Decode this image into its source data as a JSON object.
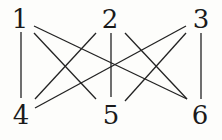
{
  "graph": {
    "name": "K3,3",
    "stroke_color": "#222222",
    "nodes": [
      {
        "id": "1",
        "label": "1",
        "x": 20,
        "y": 19
      },
      {
        "id": "2",
        "label": "2",
        "x": 110,
        "y": 19
      },
      {
        "id": "3",
        "label": "3",
        "x": 201,
        "y": 19
      },
      {
        "id": "4",
        "label": "4",
        "x": 21,
        "y": 115
      },
      {
        "id": "5",
        "label": "5",
        "x": 111,
        "y": 115
      },
      {
        "id": "6",
        "label": "6",
        "x": 200,
        "y": 115
      }
    ],
    "edges": [
      {
        "from": "1",
        "to": "4",
        "x1": 21,
        "y1": 32,
        "x2": 21,
        "y2": 98
      },
      {
        "from": "1",
        "to": "5",
        "x1": 34,
        "y1": 33,
        "x2": 96,
        "y2": 99
      },
      {
        "from": "1",
        "to": "6",
        "x1": 34,
        "y1": 26,
        "x2": 187,
        "y2": 99
      },
      {
        "from": "2",
        "to": "4",
        "x1": 96,
        "y1": 33,
        "x2": 35,
        "y2": 99
      },
      {
        "from": "2",
        "to": "5",
        "x1": 111,
        "y1": 33,
        "x2": 111,
        "y2": 97
      },
      {
        "from": "2",
        "to": "6",
        "x1": 125,
        "y1": 33,
        "x2": 187,
        "y2": 99
      },
      {
        "from": "3",
        "to": "4",
        "x1": 186,
        "y1": 26,
        "x2": 35,
        "y2": 108
      },
      {
        "from": "3",
        "to": "5",
        "x1": 186,
        "y1": 33,
        "x2": 125,
        "y2": 101
      },
      {
        "from": "3",
        "to": "6",
        "x1": 201,
        "y1": 33,
        "x2": 201,
        "y2": 99
      }
    ]
  }
}
